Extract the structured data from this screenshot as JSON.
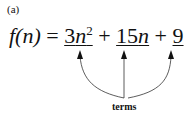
{
  "label": "(a)",
  "formula": {
    "lhs": "f(n)",
    "equals": "=",
    "term1": {
      "coef": "3",
      "var": "n",
      "exp": "2"
    },
    "plus1": "+",
    "term2": {
      "coef": "15",
      "var": "n"
    },
    "plus2": "+",
    "term3": {
      "coef": "9"
    }
  },
  "annotation": "terms"
}
